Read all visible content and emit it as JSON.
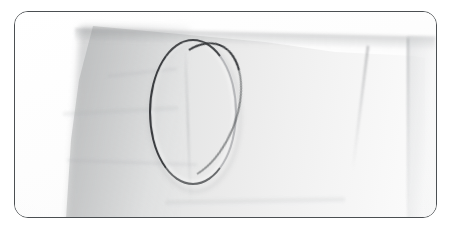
{
  "image": {
    "kind": "photograph",
    "caption": "A thin elliptical metal ring resting on a creased light grey sheet of paper or fabric against a white background",
    "frame": {
      "border_color": "#4b4f52",
      "border_radius_px": 14,
      "left_px": 14,
      "top_px": 11,
      "width_px": 423,
      "height_px": 207
    },
    "background": {
      "name": "white-backdrop",
      "color": "#ffffff"
    },
    "subjects": [
      {
        "name": "paper-sheet",
        "label": "Creased grey sheet",
        "colors": [
          "#c9cacb",
          "#dcdddd",
          "#f0f0f0",
          "#fbfbfb"
        ],
        "notes": "Diagonal left edge, sloping top edge, soft vertical creases on the right"
      },
      {
        "name": "metal-ring",
        "label": "Thin oval metal ring",
        "bounds": {
          "left_px": 148,
          "top_px": 38,
          "width_px": 88,
          "height_px": 146
        },
        "stroke_colors": [
          "#3b3d40",
          "#a8aaad"
        ],
        "notes": "Dark on the left and top arcs, faint and light on the right arc"
      }
    ],
    "details": [
      {
        "name": "crease-center",
        "label": "Faint vertical crease through the ring interior"
      },
      {
        "name": "crease-right",
        "label": "Diagonal fold line on the right of the sheet"
      },
      {
        "name": "crease-right-outer",
        "label": "Vertical fold at the far right panel"
      },
      {
        "name": "shade-left",
        "label": "Soft shadow band along the left of the sheet"
      }
    ]
  }
}
